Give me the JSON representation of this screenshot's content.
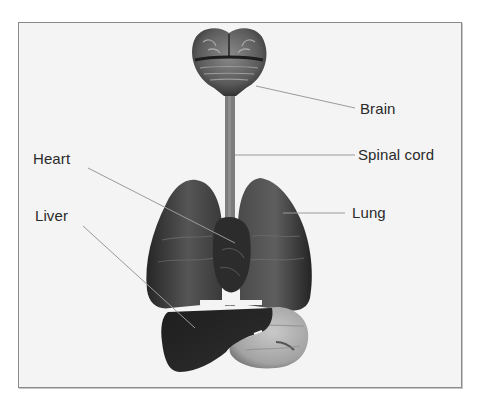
{
  "diagram": {
    "title": "",
    "labels": {
      "brain": "Brain",
      "spinal_cord": "Spinal cord",
      "heart": "Heart",
      "lung": "Lung",
      "liver": "Liver"
    },
    "organs": [
      {
        "name": "brain",
        "label": "Brain"
      },
      {
        "name": "spinal-cord",
        "label": "Spinal cord"
      },
      {
        "name": "heart",
        "label": "Heart"
      },
      {
        "name": "lung",
        "label": "Lung"
      },
      {
        "name": "liver",
        "label": "Liver"
      },
      {
        "name": "stomach",
        "label": ""
      }
    ],
    "colors": {
      "background": "#f4f4f4",
      "frame_border": "#8a8a8a",
      "leader_line": "#9a9a9a",
      "label_text": "#2a2a2a",
      "organ_dark": "#2b2b2b",
      "organ_mid": "#555555",
      "stomach": "#b5b5b5"
    }
  }
}
